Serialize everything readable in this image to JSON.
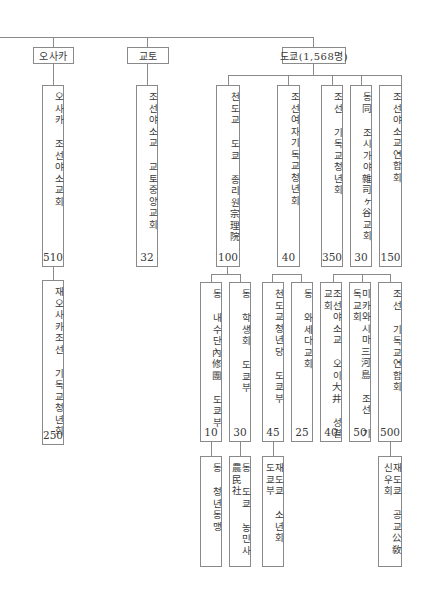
{
  "diagram": {
    "type": "organization-tree",
    "cities": [
      {
        "label": "오사카"
      },
      {
        "label": "교토"
      },
      {
        "label": "도쿄(1,568명)"
      }
    ],
    "level2": [
      {
        "label": "오사카 조선야소교회",
        "count": "510",
        "parent": "오사카"
      },
      {
        "label": "조선야소교 교토중앙교회",
        "count": "32",
        "parent": "교토"
      },
      {
        "label": "천도교 도쿄 종리원宗理院",
        "count": "100",
        "parent": "도쿄(1,568명)"
      },
      {
        "label": "조선여자기독교청년회",
        "count": "40",
        "parent": "도쿄(1,568명)"
      },
      {
        "label": "조선 기독교청년회",
        "count": "350",
        "parent": "도쿄(1,568명)"
      },
      {
        "label": "동同 조시가야雜司ヶ谷교회",
        "count": "30",
        "parent": "도쿄(1,568명)"
      },
      {
        "label": "조선야소교연합회",
        "count": "150",
        "parent": "도쿄(1,568명)"
      }
    ],
    "level3": [
      {
        "label": "재오사카조선 기독교청년회",
        "count": "250",
        "parent": "오사카 조선야소교회"
      },
      {
        "label": "동 내수단內修團 도쿄부",
        "count": "10",
        "parent": "천도교 도쿄 종리원宗理院"
      },
      {
        "label": "동 학생회 도쿄부",
        "count": "30",
        "parent": "천도교 도쿄 종리원宗理院"
      },
      {
        "label": "천도교청년당 도쿄부",
        "count": "45"
      },
      {
        "label": "동 와세다교회",
        "count": "25"
      },
      {
        "label": "조선야소교 오이大井 성결교회",
        "count": "40"
      },
      {
        "label": "미카와시마三河島 조선 기독교회",
        "count": "50"
      },
      {
        "label": "조선 기독교연합회",
        "count": "500"
      }
    ],
    "level4": [
      {
        "label": "동 청년동맹",
        "parent": "동 내수단內修團 도쿄부"
      },
      {
        "label": "동 도쿄 농민사農民社",
        "parent": "동 학생회 도쿄부"
      },
      {
        "label": "재도쿄 소년회 도쿄부",
        "parent": "천도교청년당 도쿄부"
      },
      {
        "label": "재도쿄 공교公敎신우회",
        "parent": "조선 기독교연합회"
      }
    ]
  }
}
